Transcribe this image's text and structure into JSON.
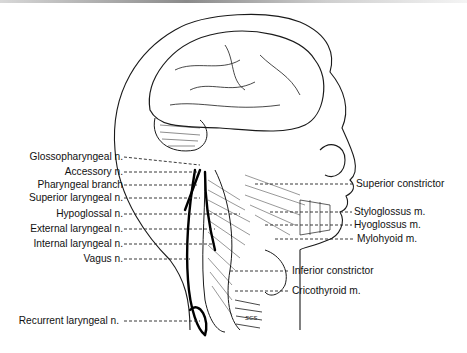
{
  "figure": {
    "artist_initials": "SCS",
    "left_labels": [
      {
        "text": "Glossopharyngeal n.",
        "y": 157
      },
      {
        "text": "Accessory n.",
        "y": 172
      },
      {
        "text": "Pharyngeal branch",
        "y": 185
      },
      {
        "text": "Superior laryngeal n.",
        "y": 198
      },
      {
        "text": "Hypoglossal n.",
        "y": 214
      },
      {
        "text": "External laryngeal n.",
        "y": 229
      },
      {
        "text": "Internal laryngeal n.",
        "y": 244
      },
      {
        "text": "Vagus n.",
        "y": 259
      },
      {
        "text": "Recurrent laryngeal n.",
        "y": 321
      }
    ],
    "right_labels": [
      {
        "text": "Superior constrictor",
        "y": 184
      },
      {
        "text": "Styloglossus m.",
        "y": 212
      },
      {
        "text": "Hyoglossus m.",
        "y": 225
      },
      {
        "text": "Mylohyoid m.",
        "y": 239
      },
      {
        "text": "Inferior constrictor",
        "y": 271
      },
      {
        "text": "Cricothyroid m.",
        "y": 291
      }
    ]
  }
}
